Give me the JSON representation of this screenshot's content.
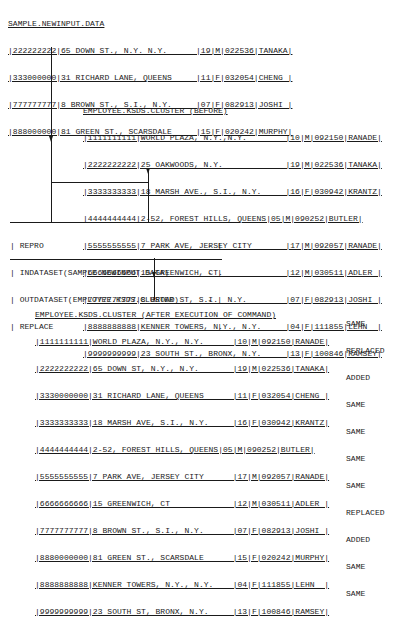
{
  "input_dataset": {
    "title": "SAMPLE.NEWINPUT.DATA",
    "rows": [
      "|222222222|65 DOWN ST., N.Y. N.Y.      |19|M|022536|TANAKA|",
      "|333000000|31 RICHARD LANE, QUEENS     |11|F|032054|CHENG |",
      "|777777777|8 BROWN ST., S.I., N.Y.     |07|F|082913|JOSHI |",
      "|888000000|81 GREEN ST., SCARSDALE     |15|F|020242|MURPHY|"
    ]
  },
  "before_cluster": {
    "title": "EMPLOYEE.KSDS.CLUSTER (BEFORE)",
    "rows": [
      "|1111111111|WORLD PLAZA, N.Y.,N.Y.        |10|M|092150|RANADE|",
      "|2222222222|25 OAKWOODS, N.Y.             |19|M|022536|TANAKA|",
      "|3333333333|18 MARSH AVE., S.I., N.Y.     |16|F|030942|KRANTZ|",
      "|4444444444|2-52, FOREST HILLS, QUEENS|05|M|090252|BUTLER|",
      "|5555555555|7 PARK AVE, JERSEY CITY       |17|M|092057|RANADE|",
      "|6666666666|15 GREENWICH, CT.             |12|M|030511|ADLER |",
      "|7777777777|8 BROAD ST, S.I.  N.Y.        |07|F|082913|JOSHI |",
      "|8888888888|KENNER TOWERS, N.Y., N.Y.     |04|F|111855|LEHN  |",
      "|9999999999|23 SOUTH ST., BRONX, N.Y.     |13|F|100846|RAMSEY|"
    ]
  },
  "command": {
    "lines": [
      {
        "text": "REPRO",
        "continuation": "-"
      },
      {
        "text": "INDATASET(SAMPLE.NEWINPUT.DATA)",
        "continuation": "-"
      },
      {
        "text": "OUTDATASET(EMPLOYEE.KSDS.CLUSTER)",
        "continuation": "-"
      },
      {
        "text": "REPLACE",
        "continuation": ""
      }
    ]
  },
  "after_cluster": {
    "title": "EMPLOYEE.KSDS.CLUSTER (AFTER EXECUTION OF COMMAND)",
    "rows": [
      {
        "record": "|1111111111|WORLD PLAZA, N.Y., N.Y.      |10|M|092150|RANADE|",
        "status": "SAME"
      },
      {
        "record": "|2222222222|65 DOWN ST, N.Y., N.Y.       |19|M|022536|TANAKA|",
        "status": "REPLACED"
      },
      {
        "record": "|3330000000|31 RICHARD LANE, QUEENS      |11|F|032054|CHENG |",
        "status": "ADDED"
      },
      {
        "record": "|3333333333|18 MARSH AVE, S.I., N.Y.     |16|F|030942|KRANTZ|",
        "status": "SAME"
      },
      {
        "record": "|4444444444|2-52, FOREST HILLS, QUEENS|05|M|090252|BUTLER|",
        "status": "SAME"
      },
      {
        "record": "|5555555555|7 PARK AVE, JERSEY CITY      |17|M|092057|RANADE|",
        "status": "SAME"
      },
      {
        "record": "|6666666666|15 GREENWICH, CT             |12|M|030511|ADLER |",
        "status": "SAME"
      },
      {
        "record": "|7777777777|8 BROWN ST., S.I., N.Y.      |07|F|082913|JOSHI |",
        "status": "REPLACED"
      },
      {
        "record": "|8880000000|81 GREEN ST., SCARSDALE      |15|F|020242|MURPHY|",
        "status": "ADDED"
      },
      {
        "record": "|8888888888|KENNER TOWERS, N.Y., N.Y.    |04|F|111855|LEHN  |",
        "status": "SAME"
      },
      {
        "record": "|9999999999|23 SOUTH ST, BRONX, N.Y.     |13|F|100846|RAMSEY|",
        "status": "SAME"
      }
    ]
  }
}
